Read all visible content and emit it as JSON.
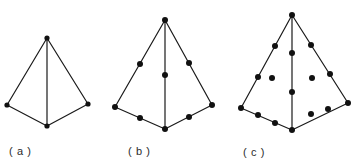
{
  "figure": {
    "background_color": "#ffffff",
    "line_color": "#1a1a1a",
    "node_color": "#111111",
    "caption_color": "#2b2b2b",
    "panels": [
      {
        "id": "a",
        "caption": "( a )",
        "caption_x": 9,
        "caption_y": 155,
        "description": "linear tetrahedron, 4 nodes",
        "node_count": 4,
        "node_radius": 2.6,
        "edge_width": 1.2,
        "vertices": {
          "apex": [
            47,
            38
          ],
          "left": [
            7,
            105
          ],
          "right": [
            88,
            104
          ],
          "bottom": [
            47,
            126
          ]
        },
        "edges": [
          [
            [
              47,
              38
            ],
            [
              7,
              105
            ]
          ],
          [
            [
              47,
              38
            ],
            [
              88,
              104
            ]
          ],
          [
            [
              47,
              38
            ],
            [
              47,
              126
            ]
          ],
          [
            [
              7,
              105
            ],
            [
              47,
              126
            ]
          ],
          [
            [
              88,
              104
            ],
            [
              47,
              126
            ]
          ]
        ],
        "nodes": [
          [
            47,
            38
          ],
          [
            7,
            105
          ],
          [
            88,
            104
          ],
          [
            47,
            126
          ]
        ]
      },
      {
        "id": "b",
        "caption": "( b )",
        "caption_x": 128,
        "caption_y": 155,
        "description": "quadratic tetrahedron, 10 nodes",
        "node_count": 10,
        "node_radius": 3.0,
        "edge_width": 1.2,
        "vertices": {
          "apex": [
            165,
            20
          ],
          "left": [
            115,
            107
          ],
          "right": [
            212,
            105
          ],
          "bottom": [
            165,
            129
          ]
        },
        "edges": [
          [
            [
              165,
              20
            ],
            [
              115,
              107
            ]
          ],
          [
            [
              165,
              20
            ],
            [
              212,
              105
            ]
          ],
          [
            [
              165,
              20
            ],
            [
              165,
              129
            ]
          ],
          [
            [
              115,
              107
            ],
            [
              165,
              129
            ]
          ],
          [
            [
              212,
              105
            ],
            [
              165,
              129
            ]
          ]
        ],
        "nodes": [
          [
            165,
            20
          ],
          [
            115,
            107
          ],
          [
            212,
            105
          ],
          [
            165,
            129
          ],
          [
            140,
            64
          ],
          [
            189,
            63
          ],
          [
            165,
            75
          ],
          [
            140,
            118
          ],
          [
            189,
            117
          ]
        ]
      },
      {
        "id": "c",
        "caption": "( c )",
        "caption_x": 243,
        "caption_y": 156,
        "description": "cubic tetrahedron, 20 nodes with face interior nodes",
        "node_count": 20,
        "node_radius": 3.0,
        "edge_width": 1.2,
        "vertices": {
          "apex": [
            292,
            15
          ],
          "left": [
            241,
            108
          ],
          "right": [
            348,
            103
          ],
          "bottom": [
            292,
            130
          ]
        },
        "edges": [
          [
            [
              292,
              15
            ],
            [
              241,
              108
            ]
          ],
          [
            [
              292,
              15
            ],
            [
              348,
              103
            ]
          ],
          [
            [
              292,
              15
            ],
            [
              292,
              130
            ]
          ],
          [
            [
              241,
              108
            ],
            [
              292,
              130
            ]
          ],
          [
            [
              348,
              103
            ],
            [
              292,
              130
            ]
          ]
        ],
        "nodes": [
          [
            292,
            15
          ],
          [
            241,
            108
          ],
          [
            348,
            103
          ],
          [
            292,
            130
          ],
          [
            275,
            46
          ],
          [
            258,
            77
          ],
          [
            311,
            45
          ],
          [
            330,
            74
          ],
          [
            292,
            53
          ],
          [
            292,
            92
          ],
          [
            258,
            115
          ],
          [
            275,
            123
          ],
          [
            311,
            114
          ],
          [
            328,
            109
          ],
          [
            272,
            78
          ],
          [
            312,
            78
          ]
        ]
      }
    ]
  }
}
